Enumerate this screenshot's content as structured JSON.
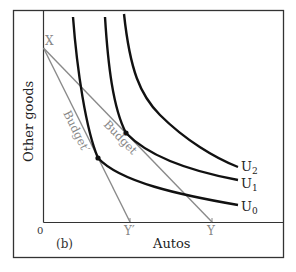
{
  "panel_label": "(b)",
  "axes": {
    "x_label": "Autos",
    "y_label": "Other goods",
    "origin_label": "0"
  },
  "points": {
    "x_intercept_label": "X",
    "y_intercept_label": "Y",
    "y_prime_intercept_label": "Y′"
  },
  "budget_lines": [
    {
      "label": "Budget",
      "from": "X",
      "to": "Y",
      "color": "#8a8a8a"
    },
    {
      "label": "Budget′",
      "from": "X",
      "to": "Y′",
      "color": "#8a8a8a"
    }
  ],
  "indifference_curves": [
    {
      "label": "U",
      "sub": "0",
      "color": "#111111"
    },
    {
      "label": "U",
      "sub": "1",
      "color": "#111111"
    },
    {
      "label": "U",
      "sub": "2",
      "color": "#111111"
    }
  ],
  "colors": {
    "frame": "#333333",
    "axis": "#333333",
    "budget": "#8a8a8a",
    "curve": "#111111",
    "label_gray": "#888888",
    "label_dark": "#222222"
  }
}
